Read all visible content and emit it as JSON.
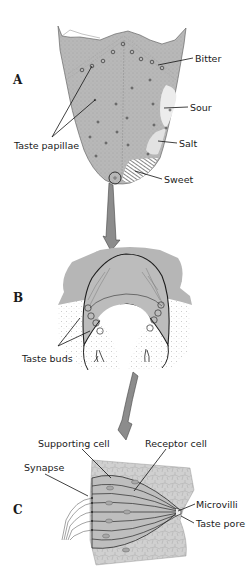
{
  "colors": {
    "tissue": "#b4b4b4",
    "tissue_light": "#d2d2d2",
    "tissue_pale": "#e6e6e6",
    "line": "#1e1e1e",
    "arrow": "#8c8c8c",
    "background": "#ffffff"
  },
  "panels": {
    "A": {
      "letter": "A",
      "subject": "tongue",
      "labels": {
        "bitter": "Bitter",
        "sour": "Sour",
        "salt": "Salt",
        "sweet": "Sweet",
        "taste_papillae": "Taste papillae"
      }
    },
    "B": {
      "letter": "B",
      "subject": "papilla cross-section",
      "labels": {
        "taste_buds": "Taste buds"
      }
    },
    "C": {
      "letter": "C",
      "subject": "taste bud",
      "labels": {
        "supporting_cell": "Supporting cell",
        "receptor_cell": "Receptor cell",
        "synapse": "Synapse",
        "microvilli": "Microvilli",
        "taste_pore": "Taste pore"
      }
    }
  }
}
